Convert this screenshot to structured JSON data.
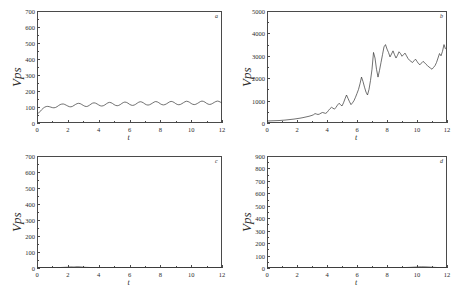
{
  "figure": {
    "panel_count": 4,
    "background": "#ffffff",
    "line_color": "#333333"
  },
  "chart_data": [
    {
      "type": "line",
      "panel_label": "a",
      "position": "top-left",
      "title": "",
      "xlabel": "t",
      "ylabel": "Vps",
      "xlim": [
        0,
        12
      ],
      "ylim": [
        0,
        700
      ],
      "xticks": [
        0,
        2,
        4,
        6,
        8,
        10,
        12
      ],
      "yticks": [
        0,
        100,
        200,
        300,
        400,
        500,
        600,
        700
      ],
      "grid": false,
      "legend": "none",
      "description": "Small amplitude periodic oscillation about a near constant mean close to 110",
      "x": [
        0.0,
        0.1,
        0.2,
        0.3,
        0.4,
        0.5,
        0.6,
        0.7,
        0.8,
        0.9,
        1.0,
        1.1,
        1.2,
        1.3,
        1.4,
        1.5,
        1.6,
        1.7,
        1.8,
        1.9,
        2.0,
        2.1,
        2.2,
        2.3,
        2.4,
        2.5,
        2.6,
        2.7,
        2.8,
        2.9,
        3.0,
        3.1,
        3.2,
        3.3,
        3.4,
        3.5,
        3.6,
        3.7,
        3.8,
        3.9,
        4.0,
        4.1,
        4.2,
        4.3,
        4.4,
        4.5,
        4.6,
        4.7,
        4.8,
        4.9,
        5.0,
        5.1,
        5.2,
        5.3,
        5.4,
        5.5,
        5.6,
        5.7,
        5.8,
        5.9,
        6.0,
        6.1,
        6.2,
        6.3,
        6.4,
        6.5,
        6.6,
        6.7,
        6.8,
        6.9,
        7.0,
        7.1,
        7.2,
        7.3,
        7.4,
        7.5,
        7.6,
        7.7,
        7.8,
        7.9,
        8.0,
        8.1,
        8.2,
        8.3,
        8.4,
        8.5,
        8.6,
        8.7,
        8.8,
        8.9,
        9.0,
        9.1,
        9.2,
        9.3,
        9.4,
        9.5,
        9.6,
        9.7,
        9.8,
        9.9,
        10.0,
        10.1,
        10.2,
        10.3,
        10.4,
        10.5,
        10.6,
        10.7,
        10.8,
        10.9,
        11.0,
        11.1,
        11.2,
        11.3,
        11.4,
        11.5,
        11.6,
        11.7,
        11.8,
        11.9,
        12.0
      ],
      "y": [
        55,
        62,
        72,
        83,
        92,
        99,
        103,
        104,
        102,
        99,
        96,
        95,
        97,
        102,
        109,
        115,
        118,
        119,
        116,
        111,
        106,
        102,
        101,
        104,
        110,
        116,
        121,
        123,
        121,
        116,
        110,
        105,
        103,
        105,
        111,
        118,
        124,
        126,
        124,
        119,
        113,
        108,
        106,
        108,
        113,
        120,
        126,
        129,
        127,
        122,
        115,
        110,
        108,
        110,
        115,
        122,
        128,
        131,
        129,
        124,
        117,
        112,
        110,
        112,
        117,
        124,
        130,
        133,
        131,
        126,
        119,
        114,
        112,
        114,
        119,
        125,
        131,
        134,
        132,
        127,
        120,
        115,
        113,
        115,
        120,
        126,
        132,
        135,
        133,
        128,
        121,
        116,
        114,
        116,
        121,
        127,
        133,
        136,
        134,
        129,
        122,
        117,
        115,
        117,
        122,
        128,
        134,
        137,
        135,
        130,
        123,
        118,
        116,
        118,
        123,
        129,
        134,
        137,
        135,
        130,
        124
      ]
    },
    {
      "type": "line",
      "panel_label": "b",
      "position": "top-right",
      "title": "",
      "xlabel": "t",
      "ylabel": "Vps",
      "xlim": [
        0,
        12
      ],
      "ylim": [
        0,
        5000
      ],
      "xticks": [
        0,
        2,
        4,
        6,
        8,
        10,
        12
      ],
      "yticks": [
        0,
        1000,
        2000,
        3000,
        4000,
        5000
      ],
      "grid": false,
      "legend": "none",
      "description": "Slow growth until t about 4 then strongly fluctuating rise to a peak near 3500 at t about 7.7, plateau near 3000, dip to 2400 near t 11, final spike to about 3500 at t 12",
      "x": [
        0.0,
        0.2,
        0.4,
        0.6,
        0.8,
        1.0,
        1.2,
        1.4,
        1.6,
        1.8,
        2.0,
        2.2,
        2.4,
        2.6,
        2.8,
        3.0,
        3.1,
        3.2,
        3.3,
        3.4,
        3.5,
        3.6,
        3.7,
        3.8,
        3.9,
        4.0,
        4.1,
        4.2,
        4.3,
        4.4,
        4.5,
        4.6,
        4.7,
        4.8,
        4.9,
        5.0,
        5.1,
        5.2,
        5.3,
        5.4,
        5.5,
        5.6,
        5.7,
        5.8,
        5.9,
        6.0,
        6.1,
        6.2,
        6.3,
        6.4,
        6.5,
        6.6,
        6.7,
        6.8,
        6.9,
        7.0,
        7.1,
        7.2,
        7.3,
        7.4,
        7.5,
        7.6,
        7.7,
        7.8,
        7.9,
        8.0,
        8.1,
        8.2,
        8.3,
        8.4,
        8.5,
        8.6,
        8.7,
        8.8,
        8.9,
        9.0,
        9.1,
        9.2,
        9.3,
        9.4,
        9.5,
        9.6,
        9.7,
        9.8,
        9.9,
        10.0,
        10.1,
        10.2,
        10.3,
        10.4,
        10.5,
        10.6,
        10.7,
        10.8,
        10.9,
        11.0,
        11.1,
        11.2,
        11.3,
        11.4,
        11.5,
        11.6,
        11.7,
        11.8,
        11.9,
        12.0
      ],
      "y": [
        90,
        95,
        100,
        105,
        110,
        120,
        130,
        145,
        160,
        175,
        195,
        215,
        240,
        270,
        300,
        340,
        370,
        420,
        400,
        380,
        400,
        440,
        470,
        450,
        430,
        470,
        560,
        640,
        700,
        660,
        620,
        700,
        800,
        880,
        820,
        760,
        900,
        1080,
        1250,
        1100,
        950,
        820,
        900,
        1000,
        1150,
        1320,
        1500,
        1750,
        2050,
        1850,
        1600,
        1380,
        1250,
        1500,
        1900,
        2400,
        3150,
        2900,
        2400,
        2050,
        2350,
        2700,
        3050,
        3400,
        3500,
        3300,
        3150,
        2950,
        3080,
        3220,
        3050,
        2900,
        3020,
        3180,
        3100,
        2980,
        3050,
        3120,
        3000,
        2880,
        2800,
        2750,
        2700,
        2780,
        2850,
        2750,
        2650,
        2600,
        2680,
        2750,
        2700,
        2620,
        2560,
        2500,
        2450,
        2400,
        2480,
        2560,
        2700,
        2900,
        3100,
        3000,
        3200,
        3500,
        3300
      ]
    },
    {
      "type": "line",
      "panel_label": "c",
      "position": "bottom-left",
      "title": "",
      "xlabel": "t",
      "ylabel": "Vps",
      "xlim": [
        0,
        12
      ],
      "ylim": [
        0,
        700
      ],
      "xticks": [
        0,
        2,
        4,
        6,
        8,
        10,
        12
      ],
      "yticks": [
        0,
        100,
        200,
        300,
        400,
        500,
        600,
        700
      ],
      "grid": false,
      "legend": "none",
      "description": "Essentially flat trace at zero with very small ripples",
      "x": [
        0.0,
        0.5,
        1.0,
        1.5,
        2.0,
        2.2,
        2.4,
        2.6,
        2.8,
        3.0,
        3.2,
        3.5,
        4.0,
        4.5,
        5.0,
        5.5,
        6.0,
        6.5,
        7.0,
        7.5,
        8.0,
        8.5,
        9.0,
        9.5,
        10.0,
        10.5,
        11.0,
        11.5,
        12.0
      ],
      "y": [
        2,
        2,
        2,
        3,
        5,
        7,
        6,
        8,
        7,
        5,
        4,
        3,
        2,
        2,
        2,
        2,
        2,
        2,
        2,
        2,
        2,
        2,
        2,
        2,
        2,
        2,
        2,
        2,
        2
      ]
    },
    {
      "type": "line",
      "panel_label": "d",
      "position": "bottom-right",
      "title": "",
      "xlabel": "t",
      "ylabel": "Vps",
      "xlim": [
        0,
        12
      ],
      "ylim": [
        0,
        900
      ],
      "xticks": [
        0,
        2,
        4,
        6,
        8,
        10,
        12
      ],
      "yticks": [
        0,
        100,
        200,
        300,
        400,
        500,
        600,
        700,
        800,
        900
      ],
      "grid": false,
      "legend": "none",
      "description": "Essentially flat trace at zero with a very small ripple near t 10 to 11",
      "x": [
        0.0,
        0.5,
        1.0,
        2.0,
        3.0,
        4.0,
        5.0,
        6.0,
        7.0,
        8.0,
        9.0,
        9.5,
        10.0,
        10.3,
        10.6,
        10.9,
        11.2,
        11.5,
        12.0
      ],
      "y": [
        2,
        2,
        2,
        2,
        2,
        2,
        2,
        2,
        2,
        2,
        3,
        5,
        8,
        10,
        9,
        7,
        5,
        3,
        2
      ]
    }
  ]
}
